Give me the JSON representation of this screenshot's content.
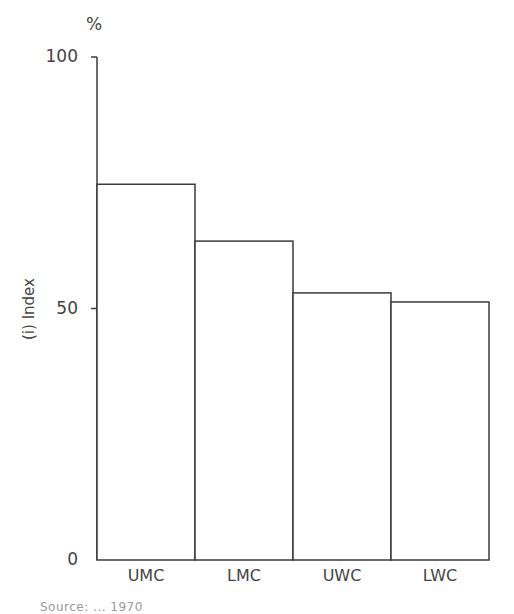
{
  "chart_data": {
    "type": "bar",
    "title": "",
    "unit_label": "%",
    "xlabel": "",
    "ylabel": "(i) Index",
    "ylim": [
      0,
      100
    ],
    "yticks": [
      0,
      50,
      100
    ],
    "categories": [
      "UMC",
      "LMC",
      "UWC",
      "LWC"
    ],
    "values": [
      74.7,
      63.4,
      53.1,
      51.3
    ],
    "grid": false,
    "legend": null,
    "bar_style": {
      "fill": "#ffffff",
      "stroke": "#3a3a3a"
    }
  },
  "axis": {
    "unit": "%",
    "ytick_labels": [
      "100",
      "50",
      "0"
    ],
    "ylabel": "(i) Index"
  },
  "caption": "Source: ... 1970"
}
